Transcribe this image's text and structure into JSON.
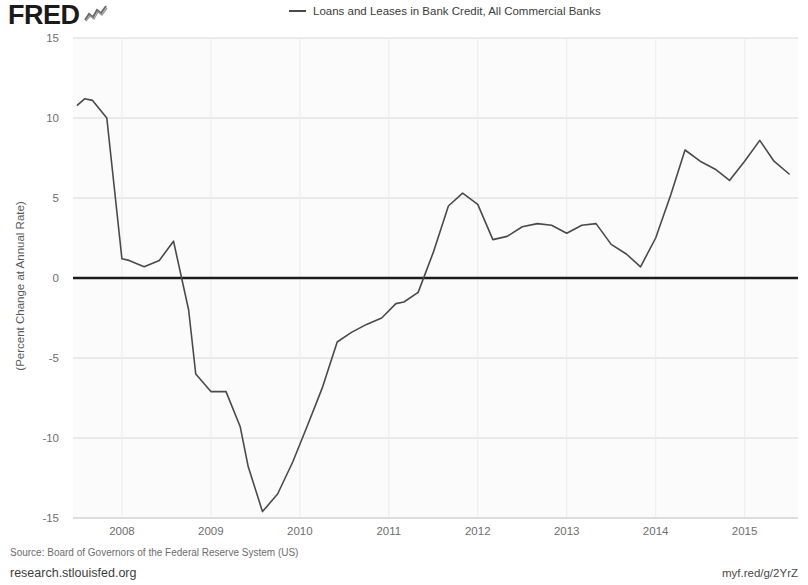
{
  "header": {
    "logo_text": "FRED",
    "logo_icon": "sparkline-icon"
  },
  "legend": {
    "entries": [
      {
        "label": "Loans and Leases in Bank Credit, All Commercial Banks",
        "color": "#4a4a4a"
      }
    ]
  },
  "footer": {
    "source": "Source: Board of Governors of the Federal Reserve System (US)",
    "site": "research.stlouisfed.org",
    "short_url": "myf.red/g/2YrZ"
  },
  "chart_data": {
    "type": "line",
    "title": "",
    "subtitle": "",
    "xlabel": "",
    "ylabel": "(Percent Change at Annual Rate)",
    "xlim": [
      2007.45,
      2015.6
    ],
    "ylim": [
      -15,
      15
    ],
    "grid": true,
    "gridlines_y": [
      15,
      10,
      5,
      0,
      -5,
      -10,
      -15
    ],
    "zero_line": 0,
    "legend_position": "top-center",
    "ytick_labels": [
      "15",
      "10",
      "5",
      "0",
      "-5",
      "-10",
      "-15"
    ],
    "ytick_values": [
      15,
      10,
      5,
      0,
      -5,
      -10,
      -15
    ],
    "xtick_labels": [
      "2008",
      "2009",
      "2010",
      "2011",
      "2012",
      "2013",
      "2014",
      "2015"
    ],
    "xtick_values": [
      2008,
      2009,
      2010,
      2011,
      2012,
      2013,
      2014,
      2015
    ],
    "series": [
      {
        "name": "Loans and Leases in Bank Credit, All Commercial Banks",
        "color": "#4a4a4a",
        "x": [
          2007.5,
          2007.58,
          2007.67,
          2007.83,
          2008.0,
          2008.08,
          2008.25,
          2008.42,
          2008.58,
          2008.75,
          2008.83,
          2009.0,
          2009.17,
          2009.33,
          2009.42,
          2009.58,
          2009.75,
          2009.92,
          2010.08,
          2010.25,
          2010.42,
          2010.58,
          2010.75,
          2010.92,
          2011.08,
          2011.17,
          2011.33,
          2011.5,
          2011.67,
          2011.83,
          2012.0,
          2012.17,
          2012.33,
          2012.5,
          2012.67,
          2012.83,
          2013.0,
          2013.17,
          2013.33,
          2013.5,
          2013.67,
          2013.83,
          2014.0,
          2014.17,
          2014.33,
          2014.5,
          2014.67,
          2014.83,
          2015.0,
          2015.17,
          2015.33,
          2015.5
        ],
        "values": [
          10.8,
          11.2,
          11.1,
          10.0,
          1.2,
          1.1,
          0.7,
          1.1,
          2.3,
          -2.0,
          -6.0,
          -7.1,
          -7.1,
          -9.3,
          -11.8,
          -14.6,
          -13.5,
          -11.5,
          -9.3,
          -6.9,
          -4.0,
          -3.4,
          -2.9,
          -2.5,
          -1.6,
          -1.5,
          -0.9,
          1.6,
          4.5,
          5.3,
          4.6,
          2.4,
          2.6,
          3.2,
          3.4,
          3.3,
          2.8,
          3.3,
          3.4,
          2.1,
          1.5,
          0.7,
          2.5,
          5.2,
          8.0,
          7.3,
          6.8,
          6.1,
          7.3,
          8.6,
          7.3,
          6.5
        ]
      }
    ]
  }
}
